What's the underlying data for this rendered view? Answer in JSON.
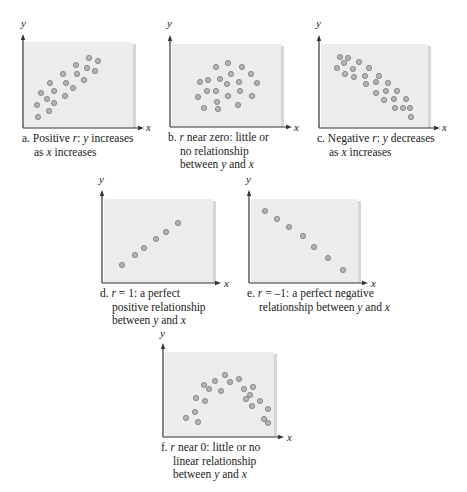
{
  "chart_data": [
    {
      "id": "a",
      "type": "scatter",
      "title": "a. Positive r: y increases as x increases",
      "caption_lines": [
        "a. Positive r: y increases",
        "as x increases"
      ],
      "xlabel": "x",
      "ylabel": "y",
      "box": {
        "x0": 24,
        "y0": 42,
        "x1": 135,
        "y1": 128
      },
      "axis": {
        "ox": 23,
        "oy": 128,
        "ytop": 34,
        "xend": 144
      },
      "label_pos": {
        "y": [
          21,
          27
        ],
        "x": [
          146,
          131
        ]
      },
      "caption_pos": [
        22,
        132
      ],
      "points": [
        [
          89,
          58
        ],
        [
          98,
          61
        ],
        [
          76,
          65
        ],
        [
          87,
          68
        ],
        [
          95,
          71
        ],
        [
          63,
          74
        ],
        [
          77,
          74
        ],
        [
          84,
          80
        ],
        [
          50,
          83
        ],
        [
          66,
          83
        ],
        [
          73,
          88
        ],
        [
          41,
          93
        ],
        [
          54,
          91
        ],
        [
          65,
          96
        ],
        [
          47,
          99
        ],
        [
          37,
          105
        ],
        [
          54,
          103
        ],
        [
          49,
          111
        ],
        [
          38,
          117
        ]
      ]
    },
    {
      "id": "b",
      "type": "scatter",
      "title": "b. r near zero: little or no relationship between y and x",
      "caption_lines": [
        "b. r near zero: little or",
        "no relationship",
        "between y and x"
      ],
      "xlabel": "x",
      "ylabel": "y",
      "box": {
        "x0": 172,
        "y0": 44,
        "x1": 283,
        "y1": 127
      },
      "axis": {
        "ox": 170,
        "oy": 127,
        "ytop": 35,
        "xend": 292
      },
      "label_pos": {
        "y": [
          167,
          27
        ],
        "x": [
          294,
          131
        ]
      },
      "caption_pos": [
        168,
        131
      ],
      "points": [
        [
          228,
          63
        ],
        [
          216,
          67
        ],
        [
          242,
          67
        ],
        [
          231,
          74
        ],
        [
          251,
          74
        ],
        [
          200,
          82
        ],
        [
          208,
          80
        ],
        [
          220,
          79
        ],
        [
          227,
          84
        ],
        [
          239,
          82
        ],
        [
          257,
          83
        ],
        [
          207,
          91
        ],
        [
          216,
          91
        ],
        [
          240,
          91
        ],
        [
          198,
          97
        ],
        [
          228,
          96
        ],
        [
          252,
          96
        ],
        [
          217,
          102
        ],
        [
          204,
          108
        ],
        [
          218,
          109
        ],
        [
          238,
          105
        ]
      ]
    },
    {
      "id": "c",
      "type": "scatter",
      "title": "c. Negative r: y decreases as x increases",
      "caption_lines": [
        "c. Negative r: y decreases",
        "as x increases"
      ],
      "xlabel": "x",
      "ylabel": "y",
      "box": {
        "x0": 321,
        "y0": 44,
        "x1": 430,
        "y1": 128
      },
      "axis": {
        "ox": 319,
        "oy": 128,
        "ytop": 35,
        "xend": 440
      },
      "label_pos": {
        "y": [
          316,
          27
        ],
        "x": [
          442,
          131
        ]
      },
      "caption_pos": [
        317,
        132
      ],
      "points": [
        [
          340,
          57
        ],
        [
          348,
          58
        ],
        [
          344,
          63
        ],
        [
          359,
          62
        ],
        [
          337,
          68
        ],
        [
          353,
          69
        ],
        [
          369,
          68
        ],
        [
          345,
          74
        ],
        [
          354,
          77
        ],
        [
          365,
          76
        ],
        [
          379,
          76
        ],
        [
          366,
          84
        ],
        [
          376,
          82
        ],
        [
          388,
          83
        ],
        [
          376,
          93
        ],
        [
          386,
          91
        ],
        [
          397,
          91
        ],
        [
          384,
          100
        ],
        [
          394,
          99
        ],
        [
          406,
          99
        ],
        [
          395,
          108
        ],
        [
          403,
          108
        ],
        [
          410,
          108
        ],
        [
          411,
          117
        ]
      ]
    },
    {
      "id": "d",
      "type": "scatter",
      "title": "d. r = 1: a perfect positive relationship between y and x",
      "caption_lines": [
        "d. r = 1: a perfect",
        "positive relationship",
        "between y and x"
      ],
      "xlabel": "x",
      "ylabel": "y",
      "box": {
        "x0": 104,
        "y0": 199,
        "x1": 215,
        "y1": 283
      },
      "axis": {
        "ox": 102,
        "oy": 283,
        "ytop": 190,
        "xend": 221
      },
      "label_pos": {
        "y": [
          99,
          183
        ],
        "x": [
          224,
          287
        ]
      },
      "caption_pos": [
        100,
        287
      ],
      "points": [
        [
          122,
          265
        ],
        [
          135,
          255
        ],
        [
          144,
          248
        ],
        [
          156,
          239
        ],
        [
          166,
          232
        ],
        [
          178,
          223
        ]
      ]
    },
    {
      "id": "e",
      "type": "scatter",
      "title": "e. r = -1: a perfect negative relationship between y and x",
      "caption_lines": [
        "e. r = –1: a perfect negative",
        "relationship between y and x"
      ],
      "xlabel": "x",
      "ylabel": "y",
      "box": {
        "x0": 251,
        "y0": 199,
        "x1": 360,
        "y1": 283
      },
      "axis": {
        "ox": 249,
        "oy": 283,
        "ytop": 190,
        "xend": 368
      },
      "label_pos": {
        "y": [
          246,
          183
        ],
        "x": [
          371,
          287
        ]
      },
      "caption_pos": [
        247,
        287
      ],
      "points": [
        [
          265,
          211
        ],
        [
          277,
          219
        ],
        [
          289,
          227
        ],
        [
          303,
          236
        ],
        [
          314,
          247
        ],
        [
          328,
          258
        ],
        [
          343,
          270
        ]
      ]
    },
    {
      "id": "f",
      "type": "scatter",
      "title": "f. r near 0: little or no linear relationship between y and x",
      "caption_lines": [
        "f. r near 0: little or no",
        "linear relationship",
        "between y and x"
      ],
      "xlabel": "x",
      "ylabel": "y",
      "box": {
        "x0": 165,
        "y0": 352,
        "x1": 276,
        "y1": 437
      },
      "axis": {
        "ox": 163,
        "oy": 437,
        "ytop": 343,
        "xend": 284
      },
      "label_pos": {
        "y": [
          160,
          337
        ],
        "x": [
          287,
          441
        ]
      },
      "caption_pos": [
        161,
        441
      ],
      "points": [
        [
          225,
          375
        ],
        [
          215,
          381
        ],
        [
          230,
          382
        ],
        [
          239,
          379
        ],
        [
          204,
          385
        ],
        [
          209,
          389
        ],
        [
          221,
          391
        ],
        [
          244,
          389
        ],
        [
          253,
          387
        ],
        [
          250,
          395
        ],
        [
          196,
          398
        ],
        [
          205,
          401
        ],
        [
          246,
          399
        ],
        [
          260,
          401
        ],
        [
          252,
          406
        ],
        [
          268,
          409
        ],
        [
          195,
          412
        ],
        [
          186,
          418
        ],
        [
          198,
          422
        ],
        [
          264,
          419
        ],
        [
          268,
          423
        ]
      ]
    }
  ],
  "colors": {
    "box_fill": "#ececec",
    "box_shadow": "#d6d6d6",
    "axis": "#333333",
    "dot_fill": "#b4b4b4",
    "dot_stroke": "#8a8a8a",
    "text": "#222222"
  }
}
